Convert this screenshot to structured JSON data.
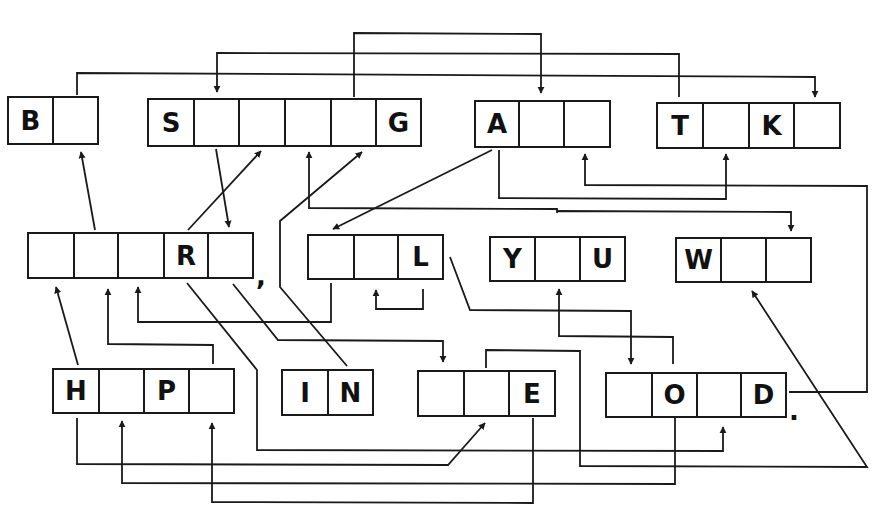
{
  "puzzle": {
    "type": "letter-link word puzzle",
    "words": [
      {
        "id": "w1",
        "row": 1,
        "cells": [
          "B",
          ""
        ]
      },
      {
        "id": "w2",
        "row": 1,
        "cells": [
          "S",
          "",
          "",
          "",
          "",
          "G"
        ]
      },
      {
        "id": "w3",
        "row": 1,
        "cells": [
          "A",
          "",
          ""
        ]
      },
      {
        "id": "w4",
        "row": 1,
        "cells": [
          "T",
          "",
          "K",
          ""
        ]
      },
      {
        "id": "w5",
        "row": 2,
        "cells": [
          "",
          "",
          "",
          "R",
          ""
        ],
        "trailing_punctuation": ","
      },
      {
        "id": "w6",
        "row": 2,
        "cells": [
          "",
          "",
          "L"
        ]
      },
      {
        "id": "w7",
        "row": 2,
        "cells": [
          "Y",
          "",
          "U"
        ]
      },
      {
        "id": "w8",
        "row": 2,
        "cells": [
          "W",
          "",
          ""
        ]
      },
      {
        "id": "w9",
        "row": 3,
        "cells": [
          "H",
          "",
          "P",
          ""
        ]
      },
      {
        "id": "w10",
        "row": 3,
        "cells": [
          "I",
          "N"
        ]
      },
      {
        "id": "w11",
        "row": 3,
        "cells": [
          "",
          "",
          "E"
        ]
      },
      {
        "id": "w12",
        "row": 3,
        "cells": [
          "",
          "O",
          "",
          "D"
        ],
        "trailing_punctuation": "."
      }
    ],
    "colors": {
      "ink": "#1a1a1a",
      "background": "#ffffff"
    }
  }
}
